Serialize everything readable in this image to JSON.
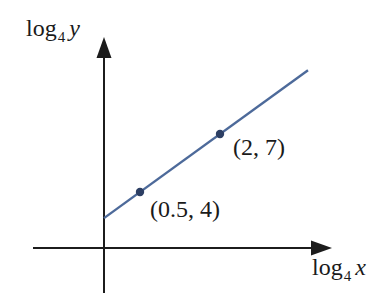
{
  "figure": {
    "y_axis_label": {
      "func": "log",
      "base": "4",
      "variable": "y"
    },
    "x_axis_label": {
      "func": "log",
      "base": "4",
      "variable": "x"
    },
    "colors": {
      "background": "#ffffff",
      "axis": "#1c1c1c",
      "line": "#4d6a9a",
      "point": "#2c3e63",
      "text": "#1a1a1a"
    }
  },
  "chart_data": {
    "type": "line",
    "title": "",
    "xlabel": "log_4 x",
    "ylabel": "log_4 y",
    "grid": false,
    "legend": "none",
    "axes_style": "schematic unlabeled axes with arrowheads",
    "series": [
      {
        "name": "straight line through marked points",
        "points": [
          {
            "x": 0.5,
            "y": 4,
            "label": "(0.5, 4)"
          },
          {
            "x": 2,
            "y": 7,
            "label": "(2, 7)"
          }
        ]
      }
    ]
  }
}
